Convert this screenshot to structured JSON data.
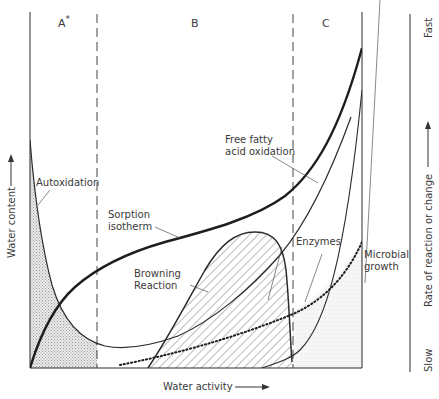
{
  "figure": {
    "zones": [
      {
        "id": "A",
        "label": "A",
        "marker": "*"
      },
      {
        "id": "B",
        "label": "B"
      },
      {
        "id": "C",
        "label": "C"
      }
    ],
    "axes": {
      "x_label": "Water activity",
      "y_left_label": "Water content",
      "y_right_label": "Rate of reaction or change",
      "y_right_top": "Fast",
      "y_right_bottom": "Slow"
    },
    "curves": [
      {
        "name": "Autoxidation",
        "label_lines": [
          "Autoxidation"
        ],
        "style": "thin",
        "fill": "stippled"
      },
      {
        "name": "Sorption isotherm",
        "label_lines": [
          "Sorption",
          "isotherm"
        ],
        "style": "thick"
      },
      {
        "name": "Free fatty acid oxidation",
        "label_lines": [
          "Free fatty",
          "acid oxidation"
        ],
        "style": "thin"
      },
      {
        "name": "Browning Reaction",
        "label_lines": [
          "Browning",
          "Reaction"
        ],
        "style": "medium",
        "fill": "hatched"
      },
      {
        "name": "Enzymes",
        "label_lines": [
          "Enzymes"
        ],
        "style": "thin"
      },
      {
        "name": "Microbial growth",
        "label_lines": [
          "Microbial",
          "growth"
        ],
        "style": "dotted",
        "fill": "light-stipple"
      }
    ],
    "colors": {
      "ink": "#2b2b2b",
      "stipple": "#bdbdbd",
      "background": "#ffffff"
    }
  }
}
